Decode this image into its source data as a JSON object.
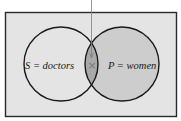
{
  "diagram": {
    "type": "venn",
    "sets": [
      {
        "id": "S",
        "label": "S = doctors",
        "fill": "#e4e4e4"
      },
      {
        "id": "P",
        "label": "P = women",
        "fill": "#cdcdcd"
      }
    ],
    "intersection": {
      "mark": "×",
      "fill": "#a9a9a9"
    },
    "universe": {
      "fill": "#e4e4e4",
      "border": "#2a2a2a"
    },
    "pointer": {
      "color": "#7f7f7f"
    }
  }
}
